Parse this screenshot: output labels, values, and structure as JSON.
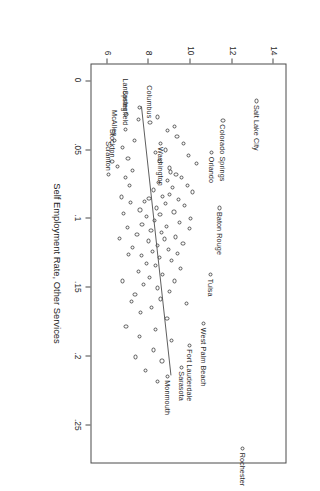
{
  "chart_data": {
    "type": "scatter",
    "title": "",
    "xlabel": "Self Employment Rate, Other Services",
    "ylabel": "",
    "xlim": [
      -0.012,
      0.278
    ],
    "ylim": [
      5.2,
      14.6
    ],
    "grid": false,
    "legend": null,
    "xticks": [
      0,
      0.05,
      0.1,
      0.15,
      0.2,
      0.25
    ],
    "xticklabels": [
      "0",
      ".05",
      ".1",
      ".15",
      ".2",
      ".25"
    ],
    "yticks": [
      6,
      8,
      10,
      12,
      14
    ],
    "yticklabels": [
      "6",
      "8",
      "10",
      "12",
      "14"
    ],
    "fit_line": {
      "type": "linear",
      "x0": 0.0185,
      "y0": 7.62,
      "x1": 0.2145,
      "y1": 9.05
    },
    "labeled_points": [
      {
        "label": "Salt Lake City",
        "x": 0.0145,
        "y": 13.2,
        "label_side": "right"
      },
      {
        "label": "Colorado Springs",
        "x": 0.0285,
        "y": 11.6,
        "label_side": "right"
      },
      {
        "label": "Orlando",
        "x": 0.052,
        "y": 11.05,
        "label_side": "right"
      },
      {
        "label": "Washington",
        "x": 0.045,
        "y": 8.62,
        "label_side": "right"
      },
      {
        "label": "Baton Rouge",
        "x": 0.092,
        "y": 11.45,
        "label_side": "right"
      },
      {
        "label": "Tulsa",
        "x": 0.1405,
        "y": 11.0,
        "label_side": "right"
      },
      {
        "label": "West Palm Beach",
        "x": 0.176,
        "y": 10.65,
        "label_side": "right"
      },
      {
        "label": "Fort Lauderdale",
        "x": 0.1915,
        "y": 10.0,
        "label_side": "right"
      },
      {
        "label": "Sarasota",
        "x": 0.2075,
        "y": 9.62,
        "label_side": "right"
      },
      {
        "label": "Monmouth",
        "x": 0.214,
        "y": 8.95,
        "label_side": "right"
      },
      {
        "label": "Rochester",
        "x": 0.2665,
        "y": 12.55,
        "label_side": "right"
      },
      {
        "label": "Columbus",
        "x": 0.03,
        "y": 8.1,
        "label_side": "left"
      },
      {
        "label": "Lancaster",
        "x": 0.0245,
        "y": 6.95,
        "label_side": "left"
      },
      {
        "label": "Springfield",
        "x": 0.035,
        "y": 6.92,
        "label_side": "left"
      },
      {
        "label": "McAllen",
        "x": 0.043,
        "y": 6.4,
        "label_side": "left"
      },
      {
        "label": "Stockton",
        "x": 0.0585,
        "y": 6.28,
        "label_side": "left"
      },
      {
        "label": "Scranton",
        "x": 0.068,
        "y": 6.12,
        "label_side": "left"
      }
    ],
    "points": [
      {
        "x": 0.0145,
        "y": 13.2
      },
      {
        "x": 0.0285,
        "y": 11.6
      },
      {
        "x": 0.052,
        "y": 11.05
      },
      {
        "x": 0.045,
        "y": 8.62
      },
      {
        "x": 0.092,
        "y": 11.45
      },
      {
        "x": 0.1405,
        "y": 11.0
      },
      {
        "x": 0.176,
        "y": 10.65
      },
      {
        "x": 0.1915,
        "y": 10.0
      },
      {
        "x": 0.2075,
        "y": 9.62
      },
      {
        "x": 0.214,
        "y": 8.95
      },
      {
        "x": 0.2665,
        "y": 12.55
      },
      {
        "x": 0.03,
        "y": 8.1
      },
      {
        "x": 0.0245,
        "y": 6.95
      },
      {
        "x": 0.035,
        "y": 6.92
      },
      {
        "x": 0.043,
        "y": 6.4
      },
      {
        "x": 0.0585,
        "y": 6.28
      },
      {
        "x": 0.068,
        "y": 6.12
      },
      {
        "x": 0.019,
        "y": 7.6
      },
      {
        "x": 0.043,
        "y": 7.35
      },
      {
        "x": 0.048,
        "y": 6.8
      },
      {
        "x": 0.056,
        "y": 7.05
      },
      {
        "x": 0.062,
        "y": 6.55
      },
      {
        "x": 0.066,
        "y": 9.1
      },
      {
        "x": 0.068,
        "y": 9.35
      },
      {
        "x": 0.07,
        "y": 9.6
      },
      {
        "x": 0.072,
        "y": 8.95
      },
      {
        "x": 0.0735,
        "y": 8.5
      },
      {
        "x": 0.0755,
        "y": 9.9
      },
      {
        "x": 0.077,
        "y": 9.2
      },
      {
        "x": 0.079,
        "y": 8.25
      },
      {
        "x": 0.0805,
        "y": 10.15
      },
      {
        "x": 0.082,
        "y": 9.05
      },
      {
        "x": 0.0835,
        "y": 8.7
      },
      {
        "x": 0.085,
        "y": 8.05
      },
      {
        "x": 0.086,
        "y": 9.45
      },
      {
        "x": 0.0875,
        "y": 7.85
      },
      {
        "x": 0.089,
        "y": 8.85
      },
      {
        "x": 0.0905,
        "y": 9.75
      },
      {
        "x": 0.092,
        "y": 8.4
      },
      {
        "x": 0.0935,
        "y": 7.62
      },
      {
        "x": 0.095,
        "y": 9.25
      },
      {
        "x": 0.0965,
        "y": 8.58
      },
      {
        "x": 0.098,
        "y": 7.95
      },
      {
        "x": 0.0995,
        "y": 10.05
      },
      {
        "x": 0.101,
        "y": 8.32
      },
      {
        "x": 0.1025,
        "y": 9.52
      },
      {
        "x": 0.104,
        "y": 7.72
      },
      {
        "x": 0.1055,
        "y": 8.88
      },
      {
        "x": 0.107,
        "y": 9.98
      },
      {
        "x": 0.1085,
        "y": 8.15
      },
      {
        "x": 0.11,
        "y": 8.65
      },
      {
        "x": 0.1115,
        "y": 7.48
      },
      {
        "x": 0.113,
        "y": 9.32
      },
      {
        "x": 0.1145,
        "y": 8.78
      },
      {
        "x": 0.116,
        "y": 8.02
      },
      {
        "x": 0.1175,
        "y": 9.68
      },
      {
        "x": 0.119,
        "y": 8.45
      },
      {
        "x": 0.1205,
        "y": 7.28
      },
      {
        "x": 0.122,
        "y": 8.98
      },
      {
        "x": 0.1235,
        "y": 8.22
      },
      {
        "x": 0.125,
        "y": 9.42
      },
      {
        "x": 0.1265,
        "y": 7.68
      },
      {
        "x": 0.128,
        "y": 8.55
      },
      {
        "x": 0.13,
        "y": 9.15
      },
      {
        "x": 0.132,
        "y": 7.92
      },
      {
        "x": 0.134,
        "y": 8.35
      },
      {
        "x": 0.136,
        "y": 9.58
      },
      {
        "x": 0.138,
        "y": 7.55
      },
      {
        "x": 0.14,
        "y": 8.72
      },
      {
        "x": 0.1425,
        "y": 8.08
      },
      {
        "x": 0.145,
        "y": 9.28
      },
      {
        "x": 0.1475,
        "y": 7.78
      },
      {
        "x": 0.15,
        "y": 8.48
      },
      {
        "x": 0.1525,
        "y": 9.05
      },
      {
        "x": 0.155,
        "y": 7.38
      },
      {
        "x": 0.158,
        "y": 8.62
      },
      {
        "x": 0.161,
        "y": 9.85
      },
      {
        "x": 0.164,
        "y": 8.18
      },
      {
        "x": 0.168,
        "y": 7.65
      },
      {
        "x": 0.172,
        "y": 8.92
      },
      {
        "x": 0.18,
        "y": 8.38
      },
      {
        "x": 0.185,
        "y": 7.58
      },
      {
        "x": 0.188,
        "y": 9.12
      },
      {
        "x": 0.195,
        "y": 8.28
      },
      {
        "x": 0.2,
        "y": 7.42
      },
      {
        "x": 0.203,
        "y": 8.68
      },
      {
        "x": 0.21,
        "y": 7.88
      },
      {
        "x": 0.218,
        "y": 8.48
      },
      {
        "x": 0.054,
        "y": 9.95
      },
      {
        "x": 0.06,
        "y": 10.35
      },
      {
        "x": 0.063,
        "y": 9.05
      },
      {
        "x": 0.065,
        "y": 7.25
      },
      {
        "x": 0.07,
        "y": 6.92
      },
      {
        "x": 0.076,
        "y": 7.12
      },
      {
        "x": 0.084,
        "y": 6.72
      },
      {
        "x": 0.088,
        "y": 7.18
      },
      {
        "x": 0.096,
        "y": 6.85
      },
      {
        "x": 0.106,
        "y": 7.02
      },
      {
        "x": 0.114,
        "y": 6.62
      },
      {
        "x": 0.126,
        "y": 7.08
      },
      {
        "x": 0.145,
        "y": 6.78
      },
      {
        "x": 0.16,
        "y": 7.22
      },
      {
        "x": 0.178,
        "y": 6.95
      },
      {
        "x": 0.04,
        "y": 9.4
      },
      {
        "x": 0.045,
        "y": 9.7
      },
      {
        "x": 0.05,
        "y": 8.85
      },
      {
        "x": 0.052,
        "y": 8.35
      },
      {
        "x": 0.036,
        "y": 8.95
      },
      {
        "x": 0.033,
        "y": 9.28
      },
      {
        "x": 0.058,
        "y": 8.55
      },
      {
        "x": 0.026,
        "y": 8.45
      },
      {
        "x": 0.028,
        "y": 7.55
      }
    ]
  },
  "axis": {
    "x_title": "Self Employment Rate, Other Services"
  }
}
